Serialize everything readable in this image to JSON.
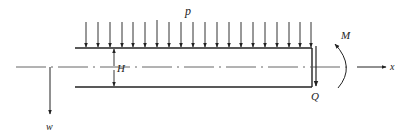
{
  "diagram": {
    "type": "beam-loading",
    "labels": {
      "load": "p",
      "height": "H",
      "moment": "M",
      "shear": "Q",
      "x_axis": "x",
      "deflection": "w"
    },
    "load_arrow_count": 20,
    "colors": {
      "stroke": "#222222",
      "background": "#ffffff"
    }
  }
}
